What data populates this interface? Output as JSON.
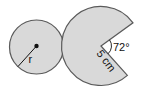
{
  "figure": {
    "left_circle": {
      "radius_label": "r",
      "fill": "#d9d9d9",
      "stroke": "#5a5a5a"
    },
    "right_sector": {
      "radius_label": "5 cm",
      "angle_label": "72°",
      "missing_angle_deg": 72,
      "fill": "#d9d9d9",
      "stroke": "#5a5a5a"
    }
  }
}
